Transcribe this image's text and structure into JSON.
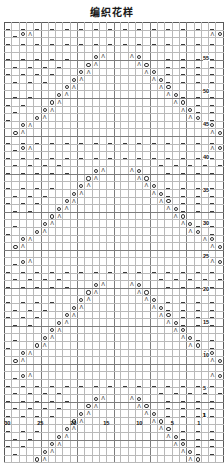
{
  "title": "编织花样",
  "chart": {
    "kind": "knitting-stitch-chart",
    "columns": 30,
    "rows": 60,
    "column_labels": [
      1,
      5,
      10,
      15,
      20,
      25,
      30
    ],
    "row_labels": [
      1,
      5,
      10,
      15,
      20,
      25,
      30,
      35,
      40,
      45,
      50,
      55
    ],
    "column_numbering_direction": "right-to-left",
    "row_numbering_direction": "bottom-to-top",
    "major_gridline_every": 5,
    "symbols": {
      "dash": "–",
      "yarnover": "O",
      "decrease": "Λ",
      "blank": ""
    },
    "symbol_names": {
      "dash": "purl-stitch",
      "yarnover": "yarn-over",
      "decrease": "decrease",
      "blank": "knit-stitch"
    },
    "colors": {
      "grid_line": "#b9b9b9",
      "major_line": "#7d7d7d",
      "border": "#5a5a5a",
      "symbol": "#333333",
      "label": "#111111",
      "background": "#ffffff"
    },
    "cells": [
      "d.d.d.d.d.d.d.d.d.d.d.d.d.d.d.",
      ".dOL........................LOd",
      "d.d.d.d.d.d.d.d.d.d.d.d.d.d.d.",
      ".d.d.d.d.............d.d.d.d.d.",
      "d.d.d.d.d...OL...LO...d.d.d.d.",
      ".d.d.d.d...OL.....LO..d.d.d.d.",
      "d.d.d.d...OL.......LO.d.d.d.d.",
      ".d.d.d...OL.........LOd.d.d.d.",
      "d.d.d...OL...........LO.d.d.d.",
      ".d.d...OL.............LOd.d.d.",
      "d.d...OL...............LO.d.d.",
      ".d...OL.................LOd.d.",
      "d...OL...................LO.d.",
      "..OL.......................LO.",
      ".OL.........................LO",
      "d.d.d.d.d.d.d.d.d.d.d.d.d.d.d.",
      ".dOL........................LOd",
      "d.d.d.d.d.d.d.d.d.d.d.d.d.d.d.",
      ".d.d.d.d.............d.d.d.d.d.",
      "d.d.d.d.d...OL...LO...d.d.d.d.",
      ".d.d.d.d...OL.....LO..d.d.d.d.",
      "d.d.d.d...OL.......LO.d.d.d.d.",
      ".d.d.d...OL.........LOd.d.d.d.",
      "d.d.d...OL...........LO.d.d.d.",
      ".d.d...OL.............LOd.d.d.",
      "d.d...OL...............LO.d.d.",
      ".d...OL.................LOd.d.",
      "d...OL...................LO.d.",
      "..OL.......................LO.",
      ".OL.........................LO",
      "d.d.d.d.d.d.d.d.d.d.d.d.d.d.d.",
      ".dOL........................LOd",
      "d.d.d.d.d.d.d.d.d.d.d.d.d.d.d.",
      ".d.d.d.d.............d.d.d.d.d.",
      "d.d.d.d.d...OL...LO...d.d.d.d.",
      ".d.d.d.d...OL.....LO..d.d.d.d.",
      "d.d.d.d...OL.......LO.d.d.d.d.",
      ".d.d.d...OL.........LOd.d.d.d.",
      "d.d.d...OL...........LO.d.d.d.",
      ".d.d...OL.............LOd.d.d.",
      "d.d...OL...............LO.d.d.",
      ".d...OL.................LOd.d.",
      "d...OL...................LO.d.",
      "..OL.......................LO.",
      ".OL.........................LO",
      "d.d.d.d.d.d.d.d.d.d.d.d.d.d.d.",
      ".dOL........................LOd",
      "d.d.d.d.d.d.d.d.d.d.d.d.d.d.d.",
      ".d.d.d.d.............d.d.d.d.d.",
      "d.d.d.d.d...OL...LO...d.d.d.d.",
      ".d.d.d.d...OL.....LO..d.d.d.d.",
      "d.d.d.d...OL.......LO.d.d.d.d.",
      ".d.d.d...OL.........LOd.d.d.d.",
      "d.d.d...OL...........LO.d.d.d.",
      ".d.d...OL.............LOd.d.d.",
      "d.d...OL...............LO.d.d.",
      ".d...OL.................LOd.d.",
      "d...OL...................LO.d.",
      "..OL.......................LO.",
      ".OL.........................LO"
    ]
  }
}
